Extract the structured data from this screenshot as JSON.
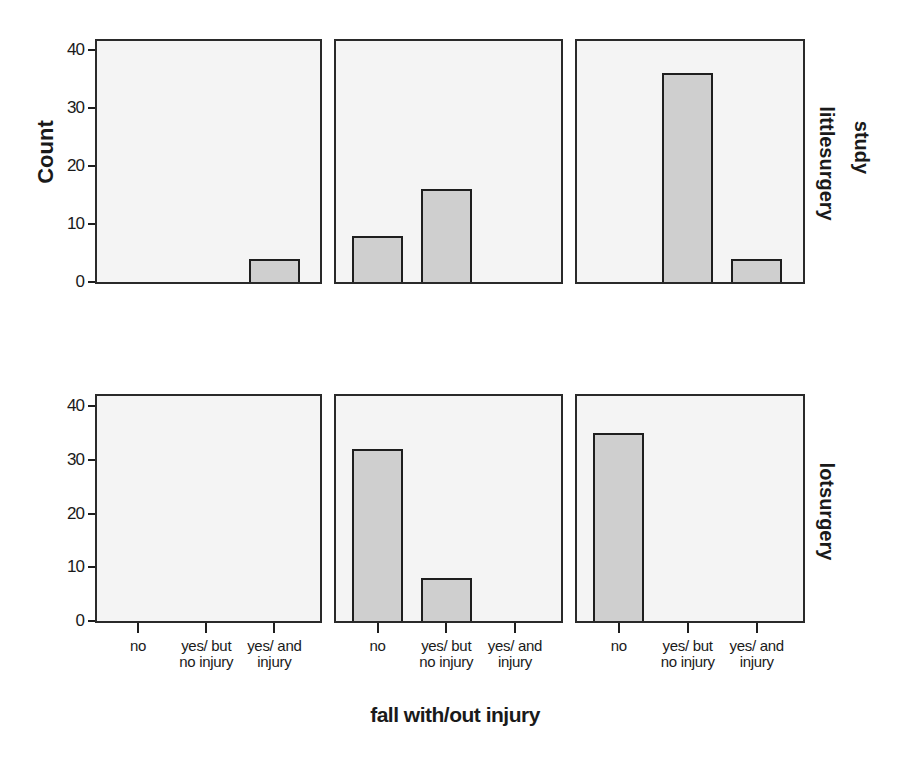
{
  "chart_data": {
    "type": "bar",
    "layout": "faceted grid 2 rows x 3 columns",
    "title": "",
    "xlabel": "fall with/out injury",
    "ylabel": "Count",
    "row_variable": "study",
    "row_labels": [
      "littlesurgery",
      "lotsurgery"
    ],
    "categories": [
      "no",
      "yes/ but no injury",
      "yes/ and injury"
    ],
    "category_lines": [
      [
        "no",
        ""
      ],
      [
        "yes/ but",
        "no injury"
      ],
      [
        "yes/ and",
        "injury"
      ]
    ],
    "yticks": [
      0,
      10,
      20,
      30,
      40
    ],
    "ylim": [
      0,
      42
    ],
    "grid": false,
    "bar_color": "#cfcfcf",
    "panels": [
      {
        "row": "littlesurgery",
        "col": 1,
        "values": [
          0,
          0,
          4
        ]
      },
      {
        "row": "littlesurgery",
        "col": 2,
        "values": [
          8,
          16,
          0
        ]
      },
      {
        "row": "littlesurgery",
        "col": 3,
        "values": [
          0,
          36,
          4
        ]
      },
      {
        "row": "lotsurgery",
        "col": 1,
        "values": [
          0,
          0,
          0
        ]
      },
      {
        "row": "lotsurgery",
        "col": 2,
        "values": [
          32,
          8,
          0
        ]
      },
      {
        "row": "lotsurgery",
        "col": 3,
        "values": [
          35,
          0,
          0
        ]
      }
    ]
  },
  "labels": {
    "ylabel": "Count",
    "xlabel": "fall with/out injury",
    "row_variable": "study",
    "row1": "littlesurgery",
    "row2": "lotsurgery"
  }
}
